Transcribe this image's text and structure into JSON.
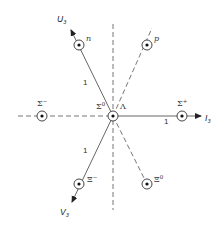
{
  "diagram": {
    "axes": {
      "i3": {
        "label": "I",
        "subscript": "3"
      },
      "u3": {
        "label": "U",
        "subscript": "3"
      },
      "v3": {
        "label": "V",
        "subscript": "3"
      }
    },
    "unit_labels": [
      "1",
      "1",
      "1"
    ],
    "particles": [
      {
        "id": "n",
        "label": "n"
      },
      {
        "id": "p",
        "label": "p"
      },
      {
        "id": "sigma-minus",
        "label": "Σ",
        "sup": "−"
      },
      {
        "id": "sigma-zero",
        "label": "Σ",
        "sup": "0"
      },
      {
        "id": "lambda",
        "label": "Λ"
      },
      {
        "id": "sigma-plus",
        "label": "Σ",
        "sup": "+"
      },
      {
        "id": "xi-minus",
        "label": "Ξ",
        "sup": "−"
      },
      {
        "id": "xi-zero",
        "label": "Ξ",
        "sup": "0"
      }
    ]
  }
}
